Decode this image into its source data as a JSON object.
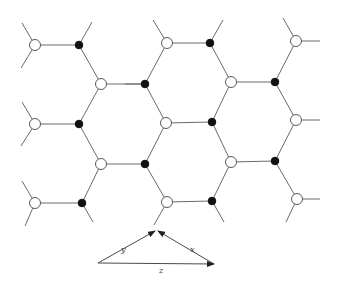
{
  "figure": {
    "legend": {
      "open_atom": "sublattice A (open circle)",
      "filled_atom": "sublattice B (filled circle)"
    },
    "colors": {
      "bond": "#6a6a6a",
      "open_fill": "#ffffff",
      "open_stroke": "#5a5a5a",
      "filled": "#111111",
      "vector": "#4a4a4a"
    }
  },
  "lattice": {
    "open_atoms": [
      [
        35,
        45
      ],
      [
        35,
        124
      ],
      [
        35,
        203
      ],
      [
        101,
        84
      ],
      [
        101,
        164
      ],
      [
        167,
        43
      ],
      [
        166,
        123
      ],
      [
        167,
        202
      ],
      [
        231,
        82
      ],
      [
        231,
        162
      ],
      [
        296,
        41
      ],
      [
        296,
        120
      ],
      [
        297,
        199
      ]
    ],
    "filled_atoms": [
      [
        79,
        45
      ],
      [
        79,
        124
      ],
      [
        82,
        203
      ],
      [
        145,
        84
      ],
      [
        145,
        164
      ],
      [
        210,
        43
      ],
      [
        212,
        122
      ],
      [
        212,
        201
      ],
      [
        275,
        82
      ],
      [
        275,
        161
      ]
    ],
    "bonds": [
      [
        [
          35,
          45
        ],
        [
          79,
          45
        ]
      ],
      [
        [
          35,
          124
        ],
        [
          79,
          124
        ]
      ],
      [
        [
          35,
          203
        ],
        [
          82,
          203
        ]
      ],
      [
        [
          101,
          84
        ],
        [
          145,
          84
        ]
      ],
      [
        [
          101,
          164
        ],
        [
          145,
          164
        ]
      ],
      [
        [
          167,
          43
        ],
        [
          210,
          43
        ]
      ],
      [
        [
          166,
          123
        ],
        [
          212,
          122
        ]
      ],
      [
        [
          167,
          202
        ],
        [
          212,
          201
        ]
      ],
      [
        [
          231,
          82
        ],
        [
          275,
          82
        ]
      ],
      [
        [
          231,
          162
        ],
        [
          275,
          161
        ]
      ],
      [
        [
          79,
          45
        ],
        [
          101,
          84
        ]
      ],
      [
        [
          101,
          84
        ],
        [
          79,
          124
        ]
      ],
      [
        [
          79,
          124
        ],
        [
          101,
          164
        ]
      ],
      [
        [
          101,
          164
        ],
        [
          82,
          203
        ]
      ],
      [
        [
          145,
          84
        ],
        [
          167,
          43
        ]
      ],
      [
        [
          145,
          84
        ],
        [
          166,
          123
        ]
      ],
      [
        [
          145,
          164
        ],
        [
          166,
          123
        ]
      ],
      [
        [
          145,
          164
        ],
        [
          167,
          202
        ]
      ],
      [
        [
          210,
          43
        ],
        [
          231,
          82
        ]
      ],
      [
        [
          231,
          82
        ],
        [
          212,
          122
        ]
      ],
      [
        [
          212,
          122
        ],
        [
          231,
          162
        ]
      ],
      [
        [
          231,
          162
        ],
        [
          212,
          201
        ]
      ],
      [
        [
          275,
          82
        ],
        [
          296,
          41
        ]
      ],
      [
        [
          275,
          82
        ],
        [
          296,
          120
        ]
      ],
      [
        [
          275,
          161
        ],
        [
          296,
          120
        ]
      ],
      [
        [
          275,
          161
        ],
        [
          297,
          199
        ]
      ]
    ],
    "stubs": [
      [
        [
          35,
          45
        ],
        [
          22,
          23
        ]
      ],
      [
        [
          35,
          45
        ],
        [
          21,
          68
        ]
      ],
      [
        [
          35,
          124
        ],
        [
          22,
          102
        ]
      ],
      [
        [
          35,
          124
        ],
        [
          21,
          146
        ]
      ],
      [
        [
          35,
          203
        ],
        [
          22,
          181
        ]
      ],
      [
        [
          35,
          203
        ],
        [
          25,
          226
        ]
      ],
      [
        [
          79,
          45
        ],
        [
          92,
          22
        ]
      ],
      [
        [
          82,
          203
        ],
        [
          93,
          222
        ]
      ],
      [
        [
          145,
          84
        ],
        [
          125,
          84
        ]
      ],
      [
        [
          167,
          43
        ],
        [
          153,
          20
        ]
      ],
      [
        [
          210,
          43
        ],
        [
          223,
          20
        ]
      ],
      [
        [
          296,
          41
        ],
        [
          283,
          18
        ]
      ],
      [
        [
          296,
          41
        ],
        [
          320,
          41
        ]
      ],
      [
        [
          296,
          120
        ],
        [
          320,
          120
        ]
      ],
      [
        [
          297,
          199
        ],
        [
          320,
          199
        ]
      ],
      [
        [
          297,
          199
        ],
        [
          286,
          222
        ]
      ],
      [
        [
          167,
          202
        ],
        [
          154,
          225
        ]
      ],
      [
        [
          212,
          201
        ],
        [
          224,
          222
        ]
      ]
    ]
  },
  "vector_diagram": {
    "origin_left": [
      98,
      263
    ],
    "apex": [
      155,
      231
    ],
    "right": [
      214,
      264
    ],
    "vectors": [
      {
        "name": "y",
        "from": [
          98,
          263
        ],
        "to": [
          155,
          231
        ],
        "label": "y",
        "label_pos": [
          121,
          252
        ]
      },
      {
        "name": "x",
        "from": [
          214,
          264
        ],
        "to": [
          158,
          231
        ],
        "label": "x",
        "label_pos": [
          190,
          252
        ]
      },
      {
        "name": "z",
        "from": [
          98,
          263
        ],
        "to": [
          214,
          264
        ],
        "label": "z",
        "label_pos": [
          159,
          273
        ]
      }
    ]
  }
}
